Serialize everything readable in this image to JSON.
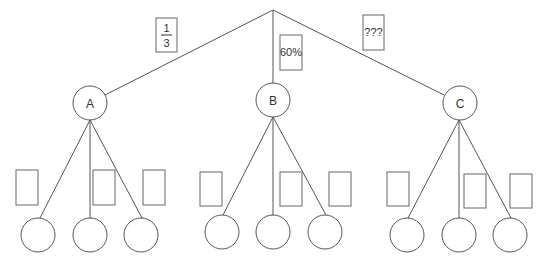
{
  "diagram": {
    "type": "probability-tree",
    "root": {
      "x": 273,
      "y": 10
    },
    "level1": [
      {
        "id": "A",
        "label": "A",
        "cx": 90,
        "cy": 103,
        "edge_label": {
          "kind": "fraction",
          "numerator": "1",
          "denominator": "3",
          "box": [
            156,
            18,
            21,
            34
          ]
        }
      },
      {
        "id": "B",
        "label": "B",
        "cx": 273,
        "cy": 100,
        "edge_label": {
          "kind": "text",
          "text": "60%",
          "box": [
            280,
            35,
            22,
            35
          ]
        }
      },
      {
        "id": "C",
        "label": "C",
        "cx": 460,
        "cy": 103,
        "edge_label": {
          "kind": "text",
          "text": "???",
          "box": [
            363,
            15,
            21,
            35
          ]
        }
      }
    ],
    "node_radius": 17,
    "leaves": {
      "A": {
        "x": [
          38,
          90,
          141
        ],
        "y": 235,
        "label_boxes": [
          [
            16,
            170,
            22,
            35
          ],
          [
            93,
            170,
            22,
            35
          ],
          [
            143,
            170,
            22,
            35
          ]
        ]
      },
      "B": {
        "x": [
          222,
          273,
          325
        ],
        "y": 232,
        "label_boxes": [
          [
            200,
            172,
            22,
            34
          ],
          [
            280,
            172,
            22,
            34
          ],
          [
            329,
            172,
            22,
            34
          ]
        ]
      },
      "C": {
        "x": [
          407,
          459,
          510
        ],
        "y": 235,
        "label_boxes": [
          [
            387,
            172,
            22,
            34
          ],
          [
            464,
            174,
            22,
            34
          ],
          [
            510,
            174,
            22,
            34
          ]
        ]
      }
    },
    "labels": {
      "edge_A_numerator": "1",
      "edge_A_denominator": "3",
      "edge_B": "60%",
      "edge_C": "???",
      "node_A": "A",
      "node_B": "B",
      "node_C": "C"
    }
  }
}
